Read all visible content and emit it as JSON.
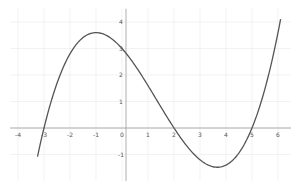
{
  "chart_data": {
    "type": "line",
    "title": "",
    "xlabel": "",
    "ylabel": "",
    "function": "f(x) = 0.1(x+3)(x-2)(x-5)",
    "xlim": [
      -4.3,
      6.5
    ],
    "ylim": [
      -2,
      4.5
    ],
    "grid": true,
    "x_ticks": [
      -4,
      -3,
      -2,
      -1,
      0,
      1,
      2,
      3,
      4,
      5,
      6
    ],
    "y_ticks": [
      -1,
      0,
      1,
      2,
      3,
      4
    ],
    "x_tick_labels": [
      "-4",
      "-3",
      "-2",
      "-1",
      "0",
      "1",
      "2",
      "3",
      "4",
      "5",
      "6"
    ],
    "y_tick_labels": [
      "-1",
      "1",
      "2",
      "3",
      "4"
    ],
    "series": [
      {
        "name": "curve",
        "color": "#555555",
        "x": [
          -3.25,
          -3,
          -2,
          -1,
          0,
          1,
          2,
          3,
          3.6,
          4,
          5,
          6.1
        ],
        "y": [
          -1.28,
          0,
          2.8,
          3.6,
          3.0,
          1.6,
          0,
          -1.2,
          -1.48,
          -1.4,
          0,
          4.4
        ]
      }
    ],
    "key_points": {
      "roots": [
        -3,
        2,
        5
      ],
      "y_intercept": 3,
      "local_max": [
        -1,
        3.6
      ],
      "local_min": [
        3.6,
        -1.48
      ]
    }
  }
}
